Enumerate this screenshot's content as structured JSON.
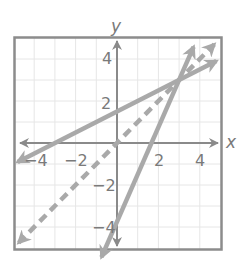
{
  "chart_data": {
    "type": "line",
    "title": "",
    "xlabel": "x",
    "ylabel": "y",
    "xlim": [
      -5,
      5
    ],
    "ylim": [
      -5,
      5
    ],
    "grid": true,
    "grid_step": 1,
    "x_ticks": [
      -4,
      -2,
      2,
      4
    ],
    "y_ticks": [
      4,
      2,
      -2,
      -4
    ],
    "x_tick_labels": [
      "−4",
      "−2",
      "2",
      "4"
    ],
    "y_tick_labels": [
      "4",
      "2",
      "−2",
      "−4"
    ],
    "series": [
      {
        "name": "line-shallow",
        "style": "solid",
        "equation": "y = 0.5x + 1.5",
        "slope": 0.5,
        "intercept": 1.5,
        "x_range": [
          -4.8,
          4.8
        ],
        "arrows": "both"
      },
      {
        "name": "line-steep",
        "style": "solid",
        "equation": "y = 2.25x - 3.75",
        "slope": 2.25,
        "intercept": -3.75,
        "x_range": [
          -0.75,
          3.7
        ],
        "arrows": "both"
      },
      {
        "name": "line-dashed",
        "style": "dashed",
        "equation": "y = x",
        "slope": 1,
        "intercept": 0,
        "x_range": [
          -4.75,
          4.7
        ],
        "arrows": "both"
      }
    ],
    "intersection": [
      3,
      3
    ],
    "colors": {
      "lines": "#a9a9a9",
      "axes": "#8a8a8a",
      "frame": "#8c8c8c",
      "grid": "#e6e6e6",
      "labels": "#7a7a7a"
    }
  }
}
